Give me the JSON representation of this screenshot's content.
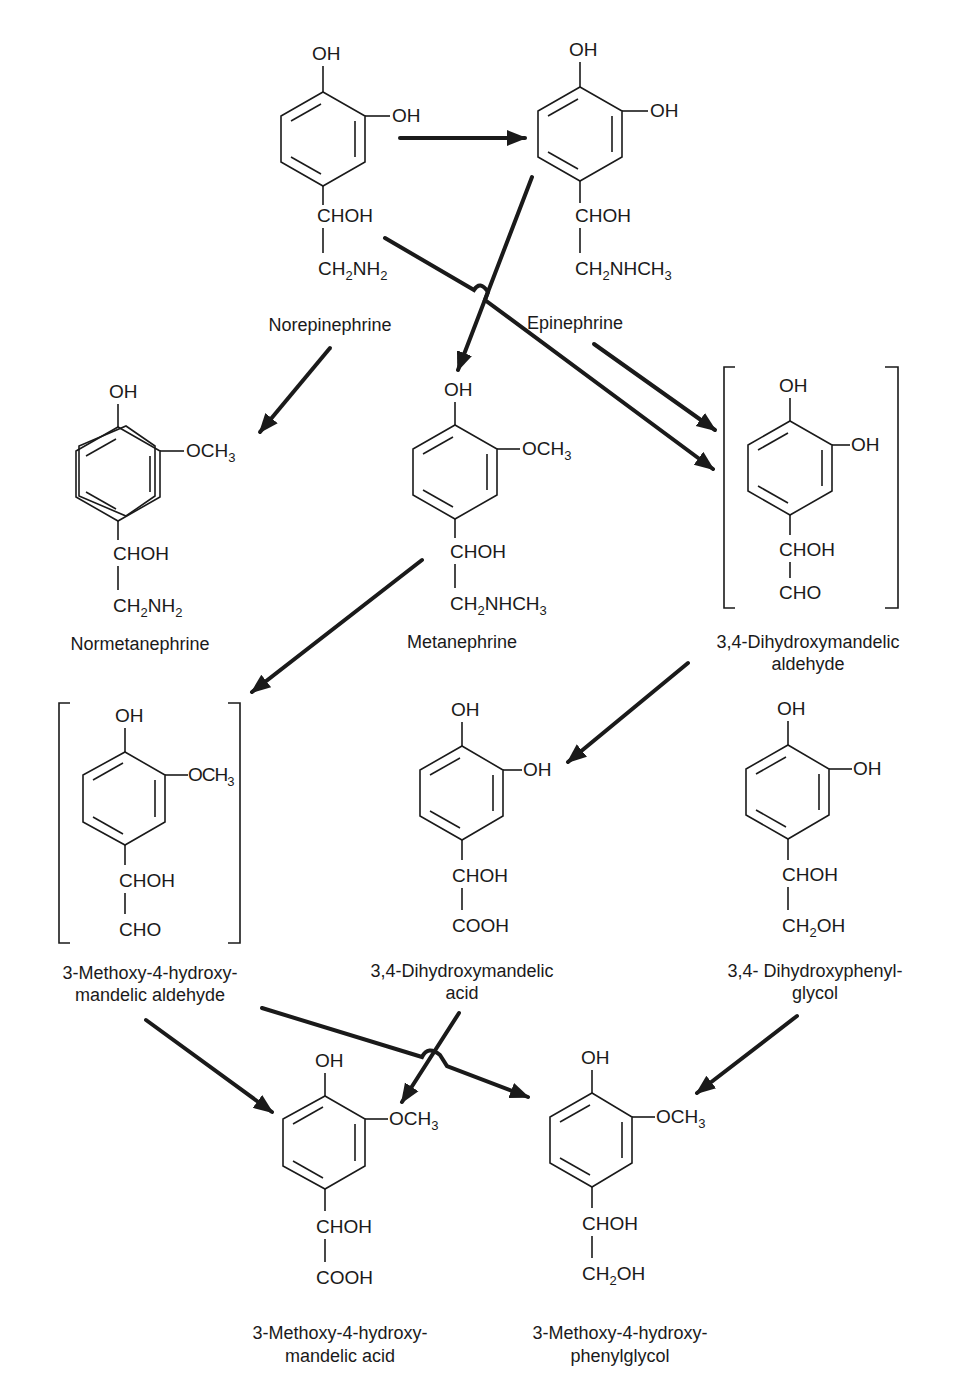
{
  "diagram": {
    "compounds": [
      {
        "id": "norepinephrine",
        "name": "Norepinephrine",
        "groups": {
          "top": "OH",
          "meta": "OH",
          "side1": "CHOH",
          "side2": "CH2NH2"
        }
      },
      {
        "id": "epinephrine",
        "name": "Epinephrine",
        "groups": {
          "top": "OH",
          "meta": "OH",
          "side1": "CHOH",
          "side2": "CH2NHCH3"
        }
      },
      {
        "id": "normetanephrine",
        "name": "Normetanephrine",
        "groups": {
          "top": "OH",
          "meta": "OCH3",
          "side1": "CHOH",
          "side2": "CH2NH2"
        }
      },
      {
        "id": "metanephrine",
        "name": "Metanephrine",
        "groups": {
          "top": "OH",
          "meta": "OCH3",
          "side1": "CHOH",
          "side2": "CH2NHCH3"
        }
      },
      {
        "id": "dhma-aldehyde",
        "name_line1": "3,4-Dihydroxymandelic",
        "name_line2": "aldehyde",
        "bracketed": true,
        "groups": {
          "top": "OH",
          "meta": "OH",
          "side1": "CHOH",
          "side2": "CHO"
        }
      },
      {
        "id": "mhma-aldehyde",
        "name_line1": "3-Methoxy-4-hydroxy-",
        "name_line2": "mandelic aldehyde",
        "bracketed": true,
        "groups": {
          "top": "OH",
          "meta": "OCH3",
          "side1": "CHOH",
          "side2": "CHO"
        }
      },
      {
        "id": "dhma-acid",
        "name_line1": "3,4-Dihydroxymandelic",
        "name_line2": "acid",
        "groups": {
          "top": "OH",
          "meta": "OH",
          "side1": "CHOH",
          "side2": "COOH"
        }
      },
      {
        "id": "dhpg",
        "name_line1": "3,4- Dihydroxyphenyl-",
        "name_line2": "glycol",
        "groups": {
          "top": "OH",
          "meta": "OH",
          "side1": "CHOH",
          "side2": "CH2OH"
        }
      },
      {
        "id": "vma",
        "name_line1": "3-Methoxy-4-hydroxy-",
        "name_line2": "mandelic acid",
        "groups": {
          "top": "OH",
          "meta": "OCH3",
          "side1": "CHOH",
          "side2": "COOH"
        }
      },
      {
        "id": "mhpg",
        "name_line1": "3-Methoxy-4-hydroxy-",
        "name_line2": "phenylglycol",
        "groups": {
          "top": "OH",
          "meta": "OCH3",
          "side1": "CHOH",
          "side2": "CH2OH"
        }
      }
    ],
    "reactions": [
      {
        "from": "Norepinephrine",
        "to": "Epinephrine"
      },
      {
        "from": "Norepinephrine",
        "to": "Normetanephrine"
      },
      {
        "from": "Norepinephrine",
        "to": "3,4-Dihydroxymandelic aldehyde"
      },
      {
        "from": "Epinephrine",
        "to": "Metanephrine"
      },
      {
        "from": "Epinephrine",
        "to": "3,4-Dihydroxymandelic aldehyde"
      },
      {
        "from": "Metanephrine",
        "to": "3-Methoxy-4-hydroxymandelic aldehyde"
      },
      {
        "from": "3,4-Dihydroxymandelic aldehyde",
        "to": "3,4-Dihydroxymandelic acid"
      },
      {
        "from": "3-Methoxy-4-hydroxymandelic aldehyde",
        "to": "3-Methoxy-4-hydroxymandelic acid"
      },
      {
        "from": "3-Methoxy-4-hydroxymandelic aldehyde",
        "to": "3-Methoxy-4-hydroxyphenylglycol"
      },
      {
        "from": "3,4-Dihydroxymandelic acid",
        "to": "3-Methoxy-4-hydroxymandelic acid"
      },
      {
        "from": "3,4-Dihydroxyphenylglycol",
        "to": "3-Methoxy-4-hydroxyphenylglycol"
      }
    ],
    "text": {
      "OH": "OH",
      "OCH": "OCH",
      "three": "3",
      "two": "2",
      "CHOH": "CHOH",
      "CH": "CH",
      "NH": "NH",
      "NHCH": "NHCH",
      "CHO": "CHO",
      "COOH": "COOH",
      "OHsuffix": "OH"
    },
    "colors": {
      "ink": "#1a1a1a",
      "background": "#ffffff"
    }
  }
}
